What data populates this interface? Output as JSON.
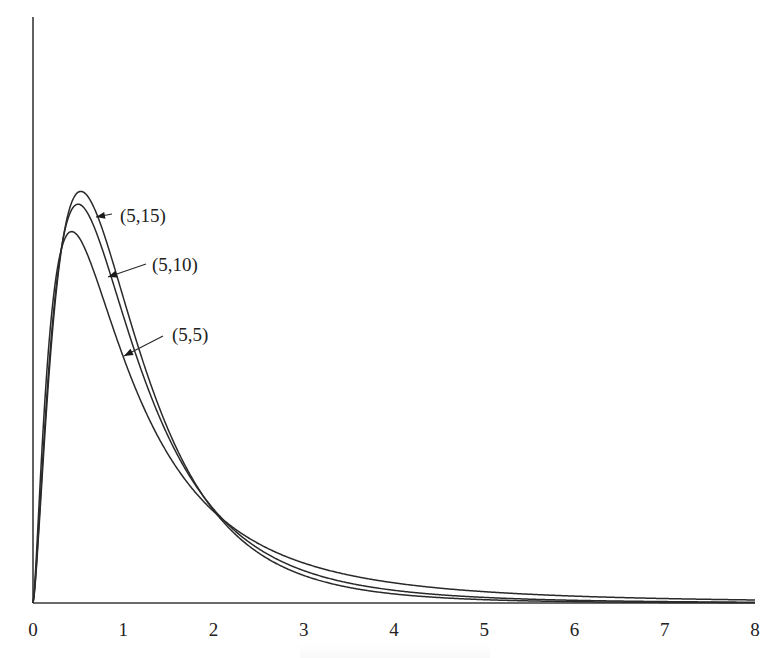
{
  "chart_data": {
    "type": "line",
    "title": "",
    "xlabel": "",
    "ylabel": "",
    "xlim": [
      0,
      8
    ],
    "ylim": [
      0,
      1.0
    ],
    "grid": false,
    "legend": "inline annotations with arrows",
    "x_ticks": [
      "0",
      "1",
      "2",
      "3",
      "4",
      "5",
      "6",
      "7",
      "8"
    ],
    "y_ticks": [],
    "series": [
      {
        "name": "(5,15)",
        "d1": 5,
        "d2": 15,
        "peak_x": 0.53,
        "peak_y": 0.72,
        "x": [
          0,
          0.25,
          0.5,
          0.75,
          1,
          1.5,
          2,
          3,
          4,
          5,
          6,
          7,
          8
        ],
        "values": [
          0,
          0.58,
          0.72,
          0.66,
          0.55,
          0.33,
          0.18,
          0.06,
          0.02,
          0.008,
          0.003,
          0.001,
          0.0005
        ]
      },
      {
        "name": "(5,10)",
        "d1": 5,
        "d2": 10,
        "peak_x": 0.5,
        "peak_y": 0.68,
        "x": [
          0,
          0.25,
          0.5,
          0.75,
          1,
          1.5,
          2,
          3,
          4,
          5,
          6,
          7,
          8
        ],
        "values": [
          0,
          0.56,
          0.68,
          0.63,
          0.53,
          0.33,
          0.19,
          0.07,
          0.03,
          0.013,
          0.006,
          0.003,
          0.0017
        ]
      },
      {
        "name": "(5,5)",
        "d1": 5,
        "d2": 5,
        "peak_x": 0.43,
        "peak_y": 0.59,
        "x": [
          0,
          0.25,
          0.5,
          0.75,
          1,
          1.5,
          2,
          3,
          4,
          5,
          6,
          7,
          8
        ],
        "values": [
          0,
          0.53,
          0.59,
          0.53,
          0.44,
          0.28,
          0.18,
          0.08,
          0.04,
          0.022,
          0.013,
          0.008,
          0.005
        ]
      }
    ]
  },
  "layout": {
    "origin_px": [
      33,
      603
    ],
    "x_px_per_unit": 90.25,
    "y_px_per_unit": 580,
    "y_axis_top_px": 17,
    "x_axis_right_px": 755
  },
  "annotations": [
    {
      "label": "(5,15)",
      "text_x": 120,
      "text_y": 222,
      "arrow_from": [
        112,
        214
      ],
      "arrow_to": [
        96,
        217
      ]
    },
    {
      "label": "(5,10)",
      "text_x": 152,
      "text_y": 271,
      "arrow_from": [
        146,
        264
      ],
      "arrow_to": [
        108,
        277
      ]
    },
    {
      "label": "(5,5)",
      "text_x": 172,
      "text_y": 341,
      "arrow_from": [
        163,
        336
      ],
      "arrow_to": [
        124,
        356
      ]
    }
  ]
}
